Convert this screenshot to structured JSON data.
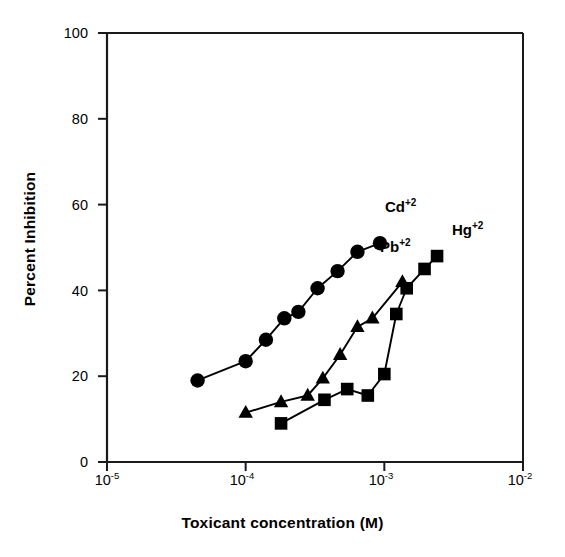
{
  "chart_data": {
    "type": "line",
    "title": "",
    "xlabel": "Toxicant concentration (M)",
    "ylabel": "Percent Inhibition",
    "xscale": "log",
    "xlim": [
      1e-05,
      0.01
    ],
    "ylim": [
      0,
      100
    ],
    "grid": false,
    "legend_position": "inline-annotations",
    "xticks": [
      {
        "value": 1e-05,
        "label": "10",
        "exponent": "-5"
      },
      {
        "value": 0.0001,
        "label": "10",
        "exponent": "-4"
      },
      {
        "value": 0.001,
        "label": "10",
        "exponent": "-3"
      },
      {
        "value": 0.01,
        "label": "10",
        "exponent": "-2"
      }
    ],
    "yticks": [
      {
        "value": 0,
        "label": "0"
      },
      {
        "value": 20,
        "label": "20"
      },
      {
        "value": 40,
        "label": "40"
      },
      {
        "value": 60,
        "label": "60"
      },
      {
        "value": 80,
        "label": "80"
      },
      {
        "value": 100,
        "label": "100"
      }
    ],
    "series": [
      {
        "name": "Cd",
        "charge": "+2",
        "label": "Cd",
        "marker": "circle",
        "color": "#000000",
        "x": [
          4.5e-05,
          0.0001,
          0.00014,
          0.00019,
          0.00024,
          0.00033,
          0.00046,
          0.00064,
          0.00093
        ],
        "y": [
          19,
          23.5,
          28.5,
          33.5,
          35,
          40.5,
          44.5,
          49,
          51
        ]
      },
      {
        "name": "Pb",
        "charge": "+2",
        "label": "Pb",
        "marker": "triangle",
        "color": "#000000",
        "x": [
          0.0001,
          0.00018,
          0.00028,
          0.00036,
          0.00048,
          0.00064,
          0.00082,
          0.00135
        ],
        "y": [
          11.5,
          14,
          15.5,
          19.5,
          25,
          31.5,
          33.5,
          42
        ]
      },
      {
        "name": "Hg",
        "charge": "+2",
        "label": "Hg",
        "marker": "square",
        "color": "#000000",
        "x": [
          0.00018,
          0.00037,
          0.00054,
          0.00076,
          0.001,
          0.00122,
          0.00145,
          0.00195,
          0.0024
        ],
        "y": [
          9,
          14.5,
          17,
          15.5,
          20.5,
          34.5,
          40.5,
          45,
          48
        ]
      }
    ],
    "annotations": [
      {
        "name": "cd-label",
        "text": "Cd",
        "superscript": "+2",
        "x_px": 385,
        "y_px": 206
      },
      {
        "name": "pb-label",
        "text": "Pb",
        "superscript": "+2",
        "x_px": 383,
        "y_px": 246
      },
      {
        "name": "hg-label",
        "text": "Hg",
        "superscript": "+2",
        "x_px": 453,
        "y_px": 229
      }
    ]
  },
  "plot_geometry": {
    "left_px": 107,
    "right_px": 523,
    "top_px": 33,
    "bottom_px": 462
  }
}
